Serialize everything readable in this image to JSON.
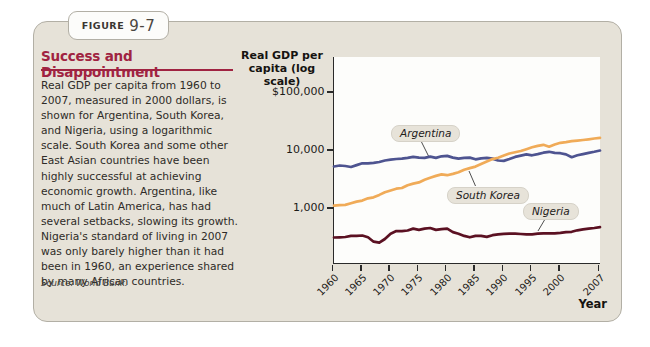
{
  "figure": {
    "label": "FIGURE",
    "number": "9-7"
  },
  "sidebar": {
    "title": "Success and Disappointment",
    "body": "Real GDP per capita from 1960 to 2007, measured in 2000 dollars, is shown for Argentina, South Korea, and Nigeria, using a logarithmic scale. South Korea and some other East Asian countries have been highly successful at achieving economic growth. Argentina, like much of Latin America, has had several setbacks, slowing its growth. Nigeria's standard of living in 2007 was only barely higher than it had been in 1960, an experience shared by many African countries.",
    "source": "Source: World Bank."
  },
  "chart": {
    "axis_title_line1": "Real GDP per",
    "axis_title_line2": "capita (log scale)",
    "x_axis_label": "Year"
  },
  "chart_data": {
    "type": "line",
    "xlabel": "Year",
    "ylabel": "Real GDP per capita (log scale)",
    "yscale": "log",
    "ylim": [
      100,
      100000
    ],
    "grid": false,
    "legend_position": "inline-labels",
    "x_tick_labels": [
      "1960",
      "1965",
      "1970",
      "1975",
      "1980",
      "1985",
      "1990",
      "1995",
      "2000",
      "2007"
    ],
    "y_tick_labels": [
      "$100,000",
      "10,000",
      "1,000"
    ],
    "y_tick_values": [
      100000,
      10000,
      1000
    ],
    "x": [
      1960,
      1961,
      1962,
      1963,
      1964,
      1965,
      1966,
      1967,
      1968,
      1969,
      1970,
      1971,
      1972,
      1973,
      1974,
      1975,
      1976,
      1977,
      1978,
      1979,
      1980,
      1981,
      1982,
      1983,
      1984,
      1985,
      1986,
      1987,
      1988,
      1989,
      1990,
      1991,
      1992,
      1993,
      1994,
      1995,
      1996,
      1997,
      1998,
      1999,
      2000,
      2001,
      2002,
      2003,
      2004,
      2005,
      2006,
      2007
    ],
    "series": [
      {
        "name": "Argentina",
        "color": "#4e5490",
        "values": [
          5200,
          5400,
          5300,
          5100,
          5500,
          5900,
          5900,
          6000,
          6200,
          6600,
          6800,
          7000,
          7100,
          7300,
          7600,
          7400,
          7300,
          7700,
          7300,
          7800,
          7900,
          7400,
          7100,
          7300,
          7400,
          6900,
          7200,
          7300,
          7100,
          6600,
          6500,
          7000,
          7600,
          8000,
          8400,
          8100,
          8500,
          9000,
          9300,
          8900,
          8800,
          8400,
          7500,
          8100,
          8500,
          8900,
          9300,
          9800
        ]
      },
      {
        "name": "South Korea",
        "color": "#f0ab58",
        "values": [
          1100,
          1120,
          1130,
          1210,
          1290,
          1340,
          1470,
          1530,
          1680,
          1870,
          2000,
          2150,
          2210,
          2470,
          2630,
          2760,
          3060,
          3330,
          3580,
          3790,
          3680,
          3870,
          4130,
          4550,
          4880,
          5180,
          5710,
          6320,
          6980,
          7370,
          8000,
          8710,
          9130,
          9600,
          10330,
          11120,
          11790,
          12280,
          11390,
          12430,
          13310,
          13710,
          14200,
          14500,
          14900,
          15300,
          15800,
          16200
        ]
      },
      {
        "name": "Nigeria",
        "color": "#5b1122",
        "values": [
          310,
          312,
          316,
          330,
          332,
          336,
          312,
          262,
          252,
          292,
          360,
          400,
          398,
          410,
          442,
          420,
          442,
          452,
          420,
          432,
          440,
          384,
          360,
          330,
          312,
          330,
          332,
          318,
          340,
          350,
          358,
          360,
          362,
          356,
          350,
          352,
          360,
          366,
          366,
          366,
          372,
          382,
          388,
          412,
          428,
          440,
          452,
          468
        ]
      }
    ]
  }
}
